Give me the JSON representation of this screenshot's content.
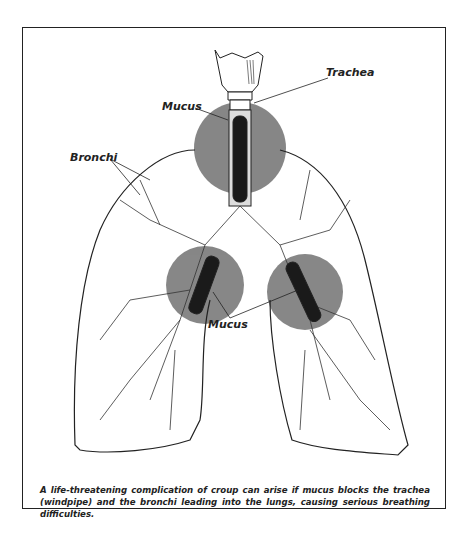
{
  "labels": {
    "trachea": "Trachea",
    "mucus_top": "Mucus",
    "bronchi": "Bronchi",
    "mucus_bottom": "Mucus"
  },
  "caption": "A life-threatening complication of croup can arise if mucus blocks the trachea (windpipe) and the bronchi leading into the lungs, causing serious breathing difficulties.",
  "colors": {
    "highlight": "#7a7a7a",
    "line": "#222222",
    "mucus": "#1a1a1a"
  }
}
